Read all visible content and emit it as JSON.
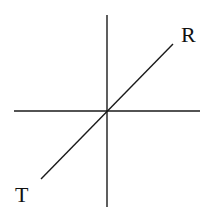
{
  "diagram": {
    "type": "axes-with-diagonal",
    "colors": {
      "line": "#1a1a1a",
      "label": "#111111",
      "background": "#ffffff"
    },
    "vertical_axis": {
      "x": 107,
      "y1": 15,
      "y2": 207
    },
    "horizontal_axis": {
      "y": 111,
      "x1": 14,
      "x2": 200
    },
    "diagonal": {
      "x1": 41,
      "y1": 179,
      "x2": 173,
      "y2": 44
    },
    "labels": [
      {
        "id": "R",
        "text": "R",
        "x": 181,
        "y": 42
      },
      {
        "id": "T",
        "text": "T",
        "x": 15,
        "y": 202
      }
    ]
  }
}
